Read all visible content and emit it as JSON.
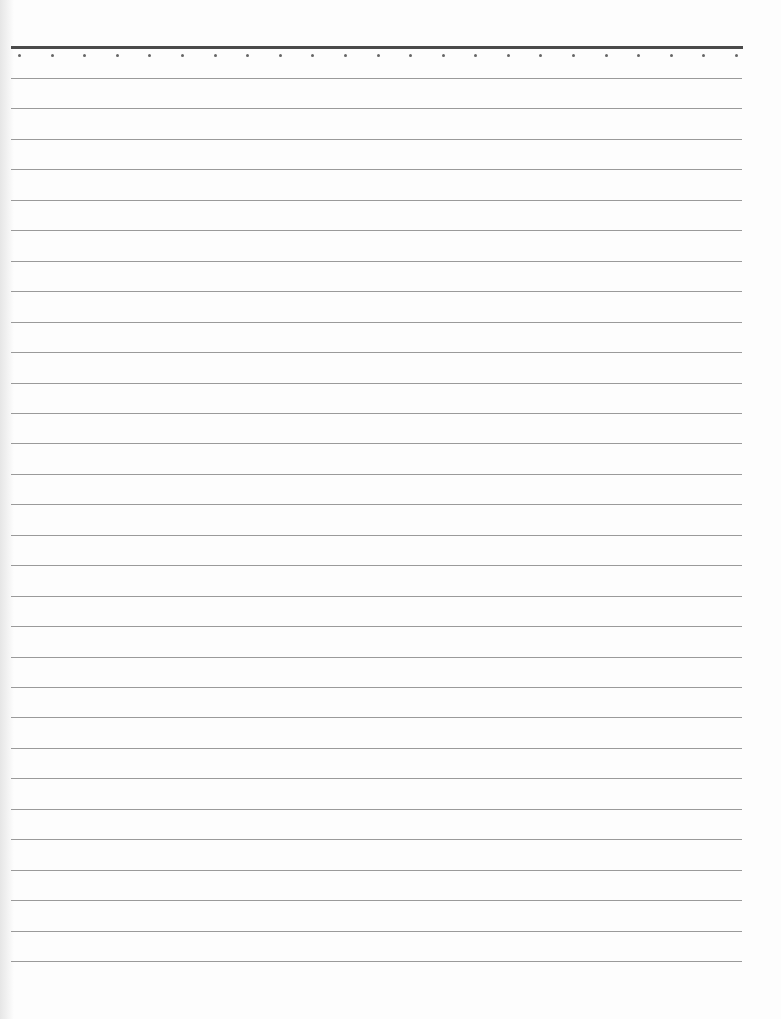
{
  "document": {
    "type": "lined paper",
    "header_rule": {
      "color": "#4a4a4a",
      "x": 11,
      "y": 46,
      "width": 732,
      "thickness": 3
    },
    "dots": {
      "count": 23,
      "y": 54,
      "x_start": 18,
      "x_end": 735,
      "color": "#666666"
    },
    "ruled_lines": {
      "count": 30,
      "y_start": 78,
      "spacing": 30.45,
      "x": 11,
      "width": 731,
      "color": "#9a9a9a"
    },
    "paper_color": "#fdfdfd"
  }
}
